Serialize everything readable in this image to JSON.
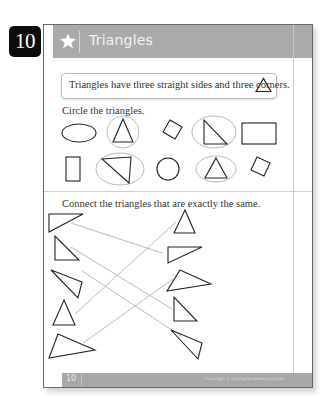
{
  "badge": {
    "number": "10"
  },
  "header": {
    "title": "Triangles",
    "icon": "star-icon",
    "band_color": "#aaaaaa"
  },
  "info_box": {
    "text": "Triangles have three straight sides and three corners.",
    "icon": "triangle-outline-icon"
  },
  "section1": {
    "instruction": "Circle the triangles.",
    "shapes": [
      {
        "row": 1,
        "shape": "ellipse",
        "circled": false
      },
      {
        "row": 1,
        "shape": "triangle",
        "circled": true
      },
      {
        "row": 1,
        "shape": "rotated-square",
        "circled": false
      },
      {
        "row": 1,
        "shape": "right-triangle",
        "circled": true
      },
      {
        "row": 1,
        "shape": "rectangle",
        "circled": false
      },
      {
        "row": 2,
        "shape": "tall-rectangle",
        "circled": false
      },
      {
        "row": 2,
        "shape": "scalene-triangle",
        "circled": true
      },
      {
        "row": 2,
        "shape": "circle",
        "circled": false
      },
      {
        "row": 2,
        "shape": "triangle",
        "circled": true
      },
      {
        "row": 2,
        "shape": "rotated-square",
        "circled": false
      }
    ]
  },
  "section2": {
    "instruction": "Connect the triangles that are exactly the same.",
    "left_triangles": 5,
    "right_triangles": 5,
    "connections": [
      {
        "left": 1,
        "right": 2
      },
      {
        "left": 2,
        "right": 4
      },
      {
        "left": 3,
        "right": 5
      },
      {
        "left": 4,
        "right": 1
      },
      {
        "left": 5,
        "right": 3
      }
    ]
  },
  "footer": {
    "page_number": "10",
    "copyright": "Copyright © Dorling Kindersley Limited"
  }
}
